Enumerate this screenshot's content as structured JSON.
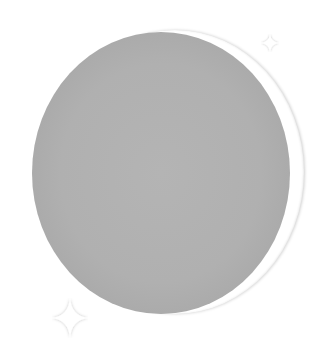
{
  "illustration": {
    "subject": "crescent-moon",
    "colors": {
      "background": "#ffffff",
      "moon_fill": "#b0b0b0",
      "moon_edge": "#9e9e9e",
      "crescent": "#ffffff",
      "sparkle": "#ffffff"
    },
    "sparkles": [
      {
        "name": "sparkle-top-right"
      },
      {
        "name": "sparkle-bottom-left"
      }
    ]
  }
}
